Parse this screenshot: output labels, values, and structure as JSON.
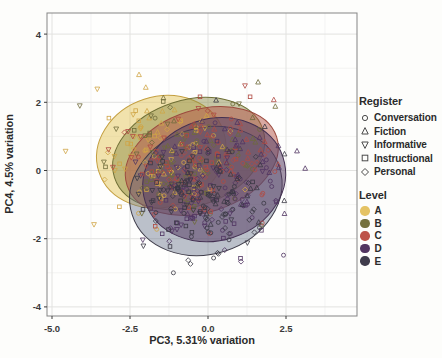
{
  "window": {
    "width": 442,
    "height": 358,
    "background": "#fdfdfb"
  },
  "legend": {
    "register": {
      "title": "Register",
      "items": [
        {
          "label": "Conversation",
          "shape": "circle"
        },
        {
          "label": "Fiction",
          "shape": "triangle-up"
        },
        {
          "label": "Informative",
          "shape": "triangle-down"
        },
        {
          "label": "Instructional",
          "shape": "square"
        },
        {
          "label": "Personal",
          "shape": "diamond"
        }
      ],
      "glyph_color": "#4a4a4a"
    },
    "level": {
      "title": "Level",
      "items": [
        {
          "label": "A",
          "color": "#e5c364"
        },
        {
          "label": "B",
          "color": "#75713d"
        },
        {
          "label": "C",
          "color": "#bd544a"
        },
        {
          "label": "D",
          "color": "#523561"
        },
        {
          "label": "E",
          "color": "#3f3c4b"
        }
      ]
    }
  },
  "chart_data": {
    "type": "scatter",
    "title": "",
    "xlabel": "PC3, 5.31% variation",
    "ylabel": "PC4, 4.5% variation",
    "xlim": [
      -5.16,
      4.78
    ],
    "ylim": [
      -4.27,
      4.62
    ],
    "xticks": {
      "values": [
        -5.0,
        -2.5,
        0.0,
        2.5
      ],
      "labels": [
        "-5.0",
        "-2.5",
        "0.0",
        "2.5"
      ]
    },
    "yticks": {
      "values": [
        4,
        2,
        0,
        -2,
        -4
      ],
      "labels": [
        "4",
        "2",
        "0",
        "-2",
        "-4"
      ]
    },
    "xminor": [
      -3.75,
      -1.25,
      1.25,
      3.75
    ],
    "yminor": [
      3,
      1,
      -1,
      -3
    ],
    "grid": true,
    "legend_position": "right",
    "encoding": "point shape = Register, point color = Level, one 95% ellipse per Level",
    "levels": [
      {
        "name": "A",
        "color": "#cfa445",
        "center": [
          -1.45,
          0.55
        ],
        "count_per_register": 18
      },
      {
        "name": "B",
        "color": "#6e6b3a",
        "center": [
          -0.7,
          0.5
        ],
        "count_per_register": 20
      },
      {
        "name": "C",
        "color": "#b04a42",
        "center": [
          -0.2,
          0.3
        ],
        "count_per_register": 24
      },
      {
        "name": "D",
        "color": "#503562",
        "center": [
          0.2,
          -0.25
        ],
        "count_per_register": 26
      },
      {
        "name": "E",
        "color": "#3a3844",
        "center": [
          -0.05,
          -0.55
        ],
        "count_per_register": 28
      }
    ],
    "registers": [
      {
        "name": "Conversation",
        "shape": "circle",
        "offset": [
          0.55,
          -0.85
        ]
      },
      {
        "name": "Fiction",
        "shape": "triangle-up",
        "offset": [
          1.15,
          0.75
        ]
      },
      {
        "name": "Informative",
        "shape": "triangle-down",
        "offset": [
          -1.45,
          0.05
        ]
      },
      {
        "name": "Instructional",
        "shape": "square",
        "offset": [
          -0.7,
          -0.5
        ]
      },
      {
        "name": "Personal",
        "shape": "diamond",
        "offset": [
          0.15,
          -0.55
        ]
      }
    ],
    "ellipses": [
      {
        "level": "A",
        "cx": -1.5,
        "cy": 0.55,
        "rx": 2.1,
        "ry": 1.62,
        "angle": -18,
        "fill": "rgba(228,197,92,0.50)",
        "stroke": "#c49f3f"
      },
      {
        "level": "B",
        "cx": -0.62,
        "cy": 0.5,
        "rx": 2.5,
        "ry": 1.56,
        "angle": -18,
        "fill": "rgba(134,134,62,0.45)",
        "stroke": "#6f6f35"
      },
      {
        "level": "C",
        "cx": -0.2,
        "cy": 0.28,
        "rx": 2.52,
        "ry": 1.5,
        "angle": -18,
        "fill": "rgba(178,82,70,0.50)",
        "stroke": "#9c4a3e"
      },
      {
        "level": "E",
        "cx": -0.07,
        "cy": -0.6,
        "rx": 2.48,
        "ry": 1.85,
        "angle": -18,
        "fill": "rgba(96,108,130,0.42)",
        "stroke": "#3e3c4a"
      },
      {
        "level": "D",
        "cx": 0.2,
        "cy": -0.27,
        "rx": 2.32,
        "ry": 1.78,
        "angle": -18,
        "fill": "rgba(88,62,100,0.55)",
        "stroke": "#443052"
      }
    ],
    "gen": {
      "seed": 11,
      "noise_sd": [
        0.95,
        0.8
      ],
      "register_weight": 0.6
    }
  }
}
